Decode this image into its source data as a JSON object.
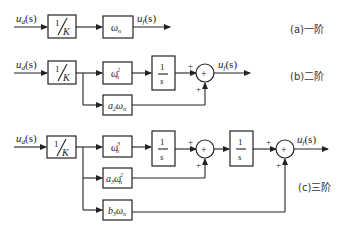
{
  "diagram": {
    "type": "block-diagram",
    "panels": [
      {
        "id": "a",
        "label": "(a)一阶",
        "input": "u_d(s)",
        "output": "u_f(s)",
        "blocks": [
          "1/K",
          "ωn"
        ]
      },
      {
        "id": "b",
        "label": "(b)二阶",
        "input": "u_d(s)",
        "output": "u_f(s)",
        "blocks": [
          "1/K",
          "ωn²",
          "1/s",
          "a₂ωn"
        ],
        "summers": [
          {
            "signs": [
              "+",
              "+"
            ]
          }
        ]
      },
      {
        "id": "c",
        "label": "(c)三阶",
        "input": "u_d(s)",
        "output": "u_f(s)",
        "blocks": [
          "1/K",
          "ωn³",
          "1/s",
          "a₃ωn²",
          "1/s",
          "b₃ωn"
        ],
        "summers": [
          {
            "signs": [
              "+",
              "+"
            ]
          },
          {
            "signs": [
              "+",
              "+"
            ]
          }
        ]
      }
    ]
  },
  "text": {
    "a_label": "(a)一阶",
    "b_label": "(b)二阶",
    "c_label": "(c)三阶",
    "u": "u",
    "d": "d",
    "f": "f",
    "s_arg": "(s)",
    "one": "1",
    "K": "K",
    "s": "s",
    "omega": "ω",
    "n": "n",
    "sq": "2",
    "cube": "3",
    "a2": "a",
    "a2sub": "2",
    "a3": "a",
    "a3sub": "3",
    "b3": "b",
    "b3sub": "3",
    "plus": "+"
  }
}
